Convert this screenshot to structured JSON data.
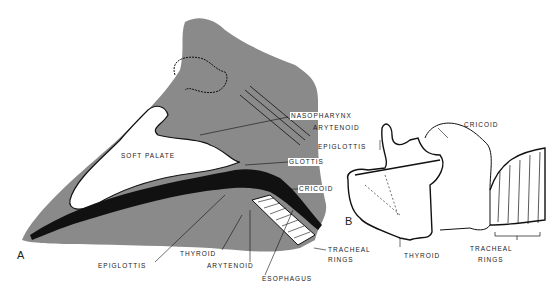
{
  "figure": {
    "panel_a": {
      "letter": "A",
      "labels": {
        "nasopharynx": "NASOPHARYNX",
        "soft_palate": "SOFT PALATE",
        "glottis": "GLOTTIS",
        "cricoid": "CRICOID",
        "thyroid": "THYROID",
        "epiglottis": "EPIGLOTTIS",
        "arytenoid": "ARYTENOID",
        "esophagus": "ESOPHAGUS",
        "tracheal_rings_1": "TRACHEAL",
        "tracheal_rings_2": "RINGS"
      }
    },
    "panel_b": {
      "letter": "B",
      "labels": {
        "arytenoid": "ARYTENOID",
        "epiglottis": "EPIGLOTTIS",
        "cricoid": "CRICOID",
        "thyroid": "THYROID",
        "tracheal_rings_1": "TRACHEAL",
        "tracheal_rings_2": "RINGS"
      }
    },
    "colors": {
      "tissue_gray": "#8a8a8a",
      "ink": "#111111",
      "background": "#ffffff"
    }
  }
}
